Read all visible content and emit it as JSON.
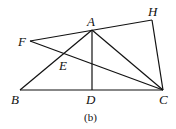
{
  "points": {
    "A": {
      "label": "A",
      "x": 92,
      "y": 30
    },
    "B": {
      "label": "B",
      "x": 20,
      "y": 90
    },
    "C": {
      "label": "C",
      "x": 163,
      "y": 90
    },
    "D": {
      "label": "D",
      "x": 92,
      "y": 90
    },
    "E": {
      "label": "E",
      "x": 65,
      "y": 53
    },
    "F": {
      "label": "F",
      "x": 30,
      "y": 41
    },
    "H": {
      "label": "H",
      "x": 152,
      "y": 20
    }
  },
  "segments": [
    "BC",
    "BA",
    "AC",
    "AD",
    "FA",
    "AH",
    "HC",
    "FC"
  ],
  "caption": "(b)"
}
